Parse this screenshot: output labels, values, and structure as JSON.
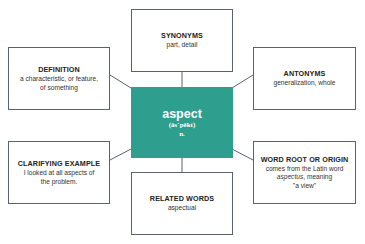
{
  "center": {
    "word": "aspect",
    "pronunciation": "(ăs´pĕkt)",
    "part_of_speech": "n.",
    "color": "#2e9e8f"
  },
  "boxes": {
    "synonyms": {
      "title": "SYNONYMS",
      "text": "part, detail"
    },
    "definition": {
      "title": "DEFINITION",
      "line1": "a characteristic, or feature,",
      "line2": "of something"
    },
    "antonyms": {
      "title": "ANTONYMS",
      "text": "generalization, whole"
    },
    "clarifying_example": {
      "title": "CLARIFYING EXAMPLE",
      "line1": "I looked at all aspects of",
      "line2": "the problem."
    },
    "word_root": {
      "title": "WORD ROOT OR ORIGIN",
      "line1": "comes from the Latin word",
      "line2_italic": "aspectus",
      "line2_rest": ", meaning",
      "line3": "\"a view\""
    },
    "related_words": {
      "title": "RELATED WORDS",
      "text": "aspectual"
    }
  }
}
